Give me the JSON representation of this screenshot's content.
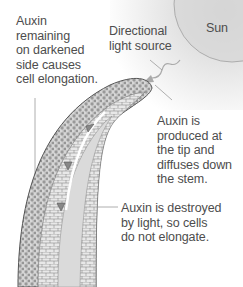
{
  "diagram": {
    "type": "biology-phototropism",
    "labels": {
      "sun": "Sun",
      "light_source": "Directional\nlight source",
      "auxin_dark_side": "Auxin\nremaining\non darkened\nside causes\ncell elongation.",
      "auxin_tip": "Auxin is\nproduced at\nthe tip and\ndiffuses down\nthe stem.",
      "auxin_destroyed": "Auxin is destroyed\nby light, so cells\ndo not elongate."
    },
    "colors": {
      "sun_fill": "#d8d8d8",
      "stem_fill": "#e6e6e6",
      "stem_outline": "#555555",
      "text": "#4d4d4d",
      "leader_line": "#9a9a9a"
    }
  }
}
